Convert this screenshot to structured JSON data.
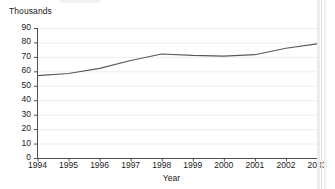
{
  "chart_data": {
    "type": "line",
    "title": "",
    "xlabel": "Year",
    "ylabel": "Thousands",
    "categories": [
      "1994",
      "1995",
      "1996",
      "1997",
      "1998",
      "1999",
      "2000",
      "2001",
      "2002",
      "2003"
    ],
    "x": [
      1994,
      1995,
      1996,
      1997,
      1998,
      1999,
      2000,
      2001,
      2002,
      2003
    ],
    "values": [
      57,
      58.5,
      62,
      67.5,
      72,
      71,
      70.5,
      71.5,
      76,
      79
    ],
    "series": [
      {
        "name": "Thousands",
        "values": [
          57,
          58.5,
          62,
          67.5,
          72,
          71,
          70.5,
          71.5,
          76,
          79
        ]
      }
    ],
    "ylim": [
      0,
      90
    ],
    "yticks": [
      0,
      10,
      20,
      30,
      40,
      50,
      60,
      70,
      80,
      90
    ],
    "ytick_labels": [
      "0",
      "10",
      "20",
      "30",
      "40",
      "50",
      "60",
      "70",
      "80",
      "90"
    ],
    "xlim": [
      1994,
      2003
    ],
    "xticks": [
      1994,
      1995,
      1996,
      1997,
      1998,
      1999,
      2000,
      2001,
      2002,
      2003
    ],
    "grid": "horizontal-faint",
    "legend": "none",
    "line_color": "#595959",
    "axis_color": "#4d4d4d",
    "grid_color": "#eeeeee",
    "background_color": "#ffffff"
  }
}
